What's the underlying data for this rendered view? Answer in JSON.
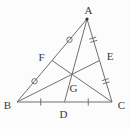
{
  "diagram": {
    "canvas": {
      "width": 131,
      "height": 129,
      "background": "#fcfcfc"
    },
    "style": {
      "line_color": "#6f6f6f",
      "label_color": "#3a3a3a",
      "line_width": 1,
      "font_size": 11,
      "dot_radius": 1.6,
      "circle_tick_radius": 2.7,
      "tick_half_length": 3.6,
      "double_tick_gap": 1.7
    },
    "points": {
      "A": {
        "x": 87,
        "y": 19,
        "label": "A",
        "lx": 88.5,
        "ly": 9.5
      },
      "B": {
        "x": 17,
        "y": 102,
        "label": "B",
        "lx": 7.5,
        "ly": 104.5
      },
      "C": {
        "x": 112,
        "y": 102,
        "label": "C",
        "lx": 121.5,
        "ly": 104.5
      },
      "D": {
        "x": 64.5,
        "y": 102,
        "label": "D",
        "lx": 63.5,
        "ly": 113.5
      },
      "E": {
        "x": 99.5,
        "y": 60.5,
        "label": "E",
        "lx": 110,
        "ly": 56
      },
      "F": {
        "x": 52,
        "y": 60.5,
        "label": "F",
        "lx": 41.5,
        "ly": 57
      },
      "G": {
        "x": 72,
        "y": 74.3,
        "label": "G",
        "lx": 73.5,
        "ly": 87.5
      }
    },
    "edges": [
      {
        "from": "A",
        "to": "B",
        "name": "side-AB"
      },
      {
        "from": "B",
        "to": "C",
        "name": "side-BC"
      },
      {
        "from": "C",
        "to": "A",
        "name": "side-CA"
      },
      {
        "from": "A",
        "to": "D",
        "name": "median-AD"
      },
      {
        "from": "B",
        "to": "E",
        "name": "median-BE"
      },
      {
        "from": "C",
        "to": "F",
        "name": "median-CF"
      }
    ],
    "ticks": [
      {
        "from": "A",
        "to": "F",
        "style": "circle",
        "name": "tick-circle-AF"
      },
      {
        "from": "F",
        "to": "B",
        "style": "circle",
        "name": "tick-circle-FB"
      },
      {
        "from": "A",
        "to": "E",
        "style": "double",
        "name": "tick-double-AE"
      },
      {
        "from": "E",
        "to": "C",
        "style": "double",
        "name": "tick-double-EC"
      },
      {
        "from": "B",
        "to": "D",
        "style": "single",
        "name": "tick-single-BD"
      },
      {
        "from": "D",
        "to": "C",
        "style": "single",
        "name": "tick-single-DC"
      }
    ],
    "dots": [
      "A"
    ]
  }
}
